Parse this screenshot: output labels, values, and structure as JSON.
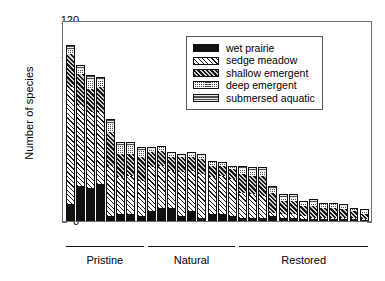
{
  "chart_data": {
    "type": "bar",
    "subtype": "stacked",
    "title": "",
    "xlabel": "",
    "ylabel": "Number of species",
    "ylim": [
      0,
      120
    ],
    "yticks": [
      0,
      20,
      40,
      60,
      80,
      100,
      120
    ],
    "grid": false,
    "legend_position": "top-right",
    "series": [
      {
        "name": "wet prairie",
        "values": [
          10,
          21,
          20,
          22,
          3,
          4,
          4,
          3,
          6,
          8,
          8,
          3,
          6,
          2,
          4,
          4,
          3,
          2,
          2,
          2,
          3,
          2,
          2,
          1,
          1,
          1,
          1,
          1,
          1,
          0
        ]
      },
      {
        "name": "sedge meadow",
        "values": [
          70,
          48,
          45,
          43,
          30,
          22,
          23,
          21,
          26,
          25,
          22,
          26,
          24,
          26,
          22,
          23,
          22,
          15,
          14,
          13,
          2,
          2,
          2,
          2,
          1,
          1,
          1,
          1,
          1,
          1
        ]
      },
      {
        "name": "shallow emergent",
        "values": [
          20,
          19,
          14,
          15,
          20,
          14,
          13,
          14,
          9,
          9,
          8,
          9,
          8,
          9,
          7,
          6,
          6,
          11,
          11,
          12,
          12,
          8,
          8,
          6,
          7,
          6,
          6,
          5,
          4,
          3
        ]
      },
      {
        "name": "deep emergent",
        "values": [
          2,
          3,
          5,
          4,
          5,
          5,
          5,
          4,
          2,
          2,
          2,
          1,
          2,
          2,
          2,
          1,
          1,
          3,
          3,
          3,
          2,
          2,
          2,
          2,
          2,
          2,
          2,
          2,
          1,
          2
        ]
      },
      {
        "name": "submersed aquatic",
        "values": [
          3,
          2,
          3,
          2,
          3,
          2,
          2,
          2,
          1,
          1,
          1,
          1,
          1,
          1,
          1,
          1,
          1,
          2,
          2,
          2,
          2,
          2,
          2,
          1,
          2,
          1,
          1,
          1,
          1,
          1
        ]
      }
    ],
    "bar_totals": [
      105,
      93,
      87,
      86,
      61,
      47,
      47,
      44,
      44,
      45,
      41,
      40,
      41,
      40,
      36,
      35,
      33,
      33,
      32,
      32,
      21,
      16,
      16,
      12,
      13,
      11,
      11,
      10,
      8,
      7
    ],
    "groups": [
      {
        "label": "Pristine",
        "start_index": 0,
        "end_index": 7
      },
      {
        "label": "Natural",
        "start_index": 8,
        "end_index": 16
      },
      {
        "label": "Restored",
        "start_index": 17,
        "end_index": 29
      }
    ]
  },
  "legend": {
    "items": [
      {
        "label": "wet prairie"
      },
      {
        "label": "sedge meadow"
      },
      {
        "label": "shallow emergent"
      },
      {
        "label": "deep emergent"
      },
      {
        "label": "submersed aquatic"
      }
    ]
  }
}
